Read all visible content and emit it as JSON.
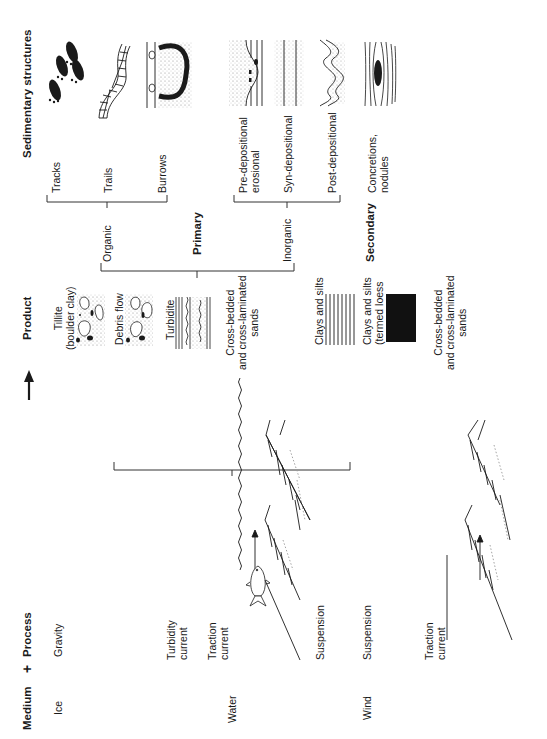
{
  "figure": {
    "orientation": "rotated-90-ccw",
    "header": {
      "medium": "Medium",
      "plus": "+",
      "process": "Process",
      "product": "Product",
      "sedimentary_structures": "Sedimentary structures"
    },
    "media": [
      {
        "label": "Ice"
      },
      {
        "label": "Water"
      },
      {
        "label": "Wind"
      }
    ],
    "processes": {
      "gravity": "Gravity",
      "turbidity_current": "Turbidity\ncurrent",
      "traction_current_water": "Traction\ncurrent",
      "suspension_water": "Suspension",
      "suspension_wind": "Suspension",
      "traction_current_wind": "Traction\ncurrent"
    },
    "products": {
      "tillite": "Tillite\n(boulder clay)",
      "debris_flow": "Debris flow",
      "turbidite": "Turbidite",
      "cross_bedded_water": "Cross-bedded\nand cross-laminated\nsands",
      "clays_silts": "Clays and silts",
      "clays_silts_loess": "Clays and silts\n(termed loess",
      "cross_bedded_wind": "Cross-bedded\nand cross-laminated\nsands"
    },
    "classification": {
      "primary": "Primary",
      "secondary": "Secondary",
      "organic": "Organic",
      "inorganic": "Inorganic",
      "organic_items": [
        "Tracks",
        "Trails",
        "Burrows"
      ],
      "inorganic_items": [
        "Pre-depositional\nerosional",
        "Syn-depositional",
        "Post-depositional"
      ],
      "secondary_items": [
        "Concretions,\nnodules"
      ]
    },
    "icons": [
      "tracks-icon",
      "trails-icon",
      "burrows-icon",
      "pre-depositional-icon",
      "syn-depositional-icon",
      "post-depositional-icon",
      "concretion-icon",
      "fish-icon",
      "arrow-icon",
      "cross-bedding-icon",
      "tillite-icon",
      "turbidite-icon",
      "loess-block-icon"
    ],
    "colors": {
      "ink": "#1a1a1a",
      "background": "#ffffff"
    }
  }
}
